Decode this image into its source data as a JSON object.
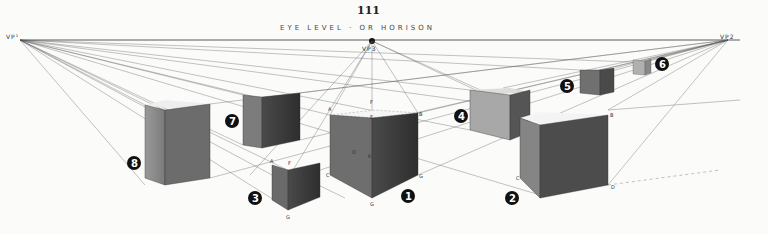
{
  "page": {
    "page_number": "111",
    "horizon_label": "EYE LEVEL · OR HORISON",
    "vanishing_points": [
      {
        "label": "VP¹",
        "x": 20,
        "y": 40
      },
      {
        "label": "VP3",
        "x": 372,
        "y": 41
      },
      {
        "label": "VP2",
        "x": 728,
        "y": 40
      }
    ]
  },
  "cubes": [
    {
      "id": 1,
      "label": "1",
      "points": [
        "A",
        "B",
        "C",
        "E",
        "F",
        "G",
        "O",
        "K"
      ]
    },
    {
      "id": 2,
      "label": "2",
      "points": [
        "B",
        "C",
        "D"
      ]
    },
    {
      "id": 3,
      "label": "3",
      "points": [
        "A",
        "E",
        "F",
        "G"
      ]
    },
    {
      "id": 4,
      "label": "4"
    },
    {
      "id": 5,
      "label": "5"
    },
    {
      "id": 6,
      "label": "6"
    },
    {
      "id": 7,
      "label": "7"
    },
    {
      "id": 8,
      "label": "8"
    }
  ],
  "colors": {
    "paper": "#fbfbfa",
    "ink": "#222222",
    "shade_light": "#8a8a8a",
    "shade_dark": "#3a3a3a"
  }
}
